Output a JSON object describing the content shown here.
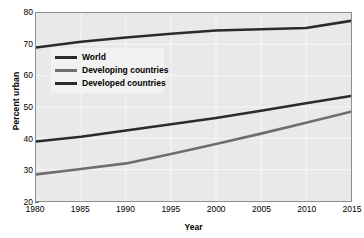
{
  "chart_data": {
    "type": "line",
    "title": "",
    "xlabel": "Year",
    "ylabel": "Percent urban",
    "xlim": [
      1980,
      2015
    ],
    "ylim": [
      20,
      80
    ],
    "grid": true,
    "legend_position": "inside-upper-left",
    "x_ticks": [
      "1980",
      "1985",
      "1990",
      "1995",
      "2000",
      "2005",
      "2010",
      "2015"
    ],
    "x_tick_values": [
      1980,
      1985,
      1990,
      1995,
      2000,
      2005,
      2010,
      2015
    ],
    "y_ticks": [
      "20",
      "30",
      "40",
      "50",
      "60",
      "70",
      "80"
    ],
    "y_tick_values": [
      20,
      30,
      40,
      50,
      60,
      70,
      80
    ],
    "x": [
      1980,
      1985,
      1990,
      1995,
      2000,
      2005,
      2010,
      2015
    ],
    "series": [
      {
        "name": "World",
        "color": "#2b2b2b",
        "values": [
          39.0,
          40.5,
          42.5,
          44.5,
          46.5,
          48.8,
          51.2,
          53.5
        ]
      },
      {
        "name": "Developing countries",
        "color": "#6e6e6e",
        "values": [
          28.5,
          30.2,
          32.0,
          35.0,
          38.2,
          41.5,
          45.0,
          48.5
        ]
      },
      {
        "name": "Developed countries",
        "color": "#2b2b2b",
        "values": [
          69.0,
          70.8,
          72.2,
          73.4,
          74.4,
          74.8,
          75.2,
          77.5
        ]
      }
    ],
    "legend": [
      {
        "label": "World",
        "color": "#2b2b2b"
      },
      {
        "label": "Developing countries",
        "color": "#6e6e6e"
      },
      {
        "label": "Developed countries",
        "color": "#2b2b2b"
      }
    ],
    "colors": {
      "plot_background": "#e9e9e9",
      "page_background": "#ffffff",
      "gridline": "#f7f7f7",
      "frame": "#8e8e8e",
      "text": "#000000",
      "legend_background": "#f2f2f2"
    }
  }
}
